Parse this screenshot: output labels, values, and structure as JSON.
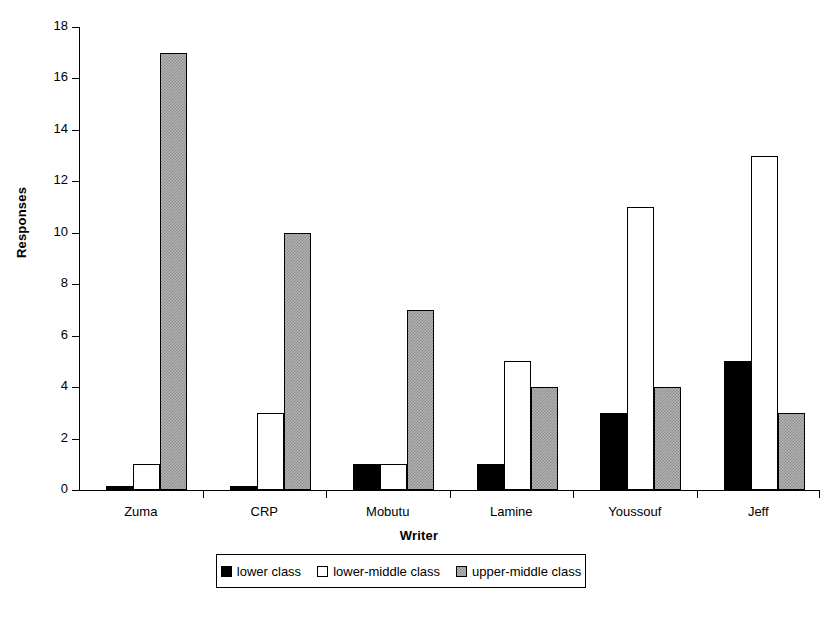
{
  "chart_data": {
    "type": "bar",
    "title": "",
    "xlabel": "Writer",
    "ylabel": "Responses",
    "categories": [
      "Zuma",
      "CRP",
      "Mobutu",
      "Lamine",
      "Youssouf",
      "Jeff"
    ],
    "series": [
      {
        "name": "lower class",
        "values": [
          0.15,
          0.15,
          1,
          1,
          3,
          5
        ]
      },
      {
        "name": "lower-middle class",
        "values": [
          1,
          3,
          1,
          5,
          11,
          13
        ]
      },
      {
        "name": "upper-middle class",
        "values": [
          17,
          10,
          7,
          4,
          4,
          3
        ]
      }
    ],
    "ylim": [
      0,
      18
    ],
    "yticks": [
      0,
      2,
      4,
      6,
      8,
      10,
      12,
      14,
      16,
      18
    ],
    "ytick_labels": [
      "0",
      "2",
      "4",
      "6",
      "8",
      "10",
      "12",
      "14",
      "16",
      "18"
    ],
    "grid": false,
    "legend_position": "bottom",
    "colors": {
      "lower class": "#000000",
      "lower-middle class": "#ffffff",
      "upper-middle class": "#b3b3b3",
      "axis": "#000000",
      "background": "#ffffff"
    }
  },
  "legend": {
    "entries": [
      {
        "label": "lower class",
        "swatch": "black-square-icon"
      },
      {
        "label": "lower-middle class",
        "swatch": "white-square-icon"
      },
      {
        "label": "upper-middle class",
        "swatch": "gray-hatched-square-icon"
      }
    ]
  }
}
